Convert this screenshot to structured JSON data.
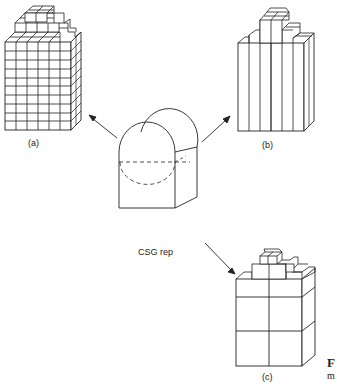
{
  "diagram": {
    "center": {
      "label": "CSG rep",
      "shape": "block-with-rounded-top"
    },
    "views": [
      {
        "id": "a",
        "label": "(a)",
        "description": "uniform voxel (spatial-occupancy) enumeration"
      },
      {
        "id": "b",
        "label": "(b)",
        "description": "column / ray representation"
      },
      {
        "id": "c",
        "label": "(c)",
        "description": "octree representation"
      }
    ],
    "arrows": [
      {
        "from": "CSG rep",
        "to": "(a)"
      },
      {
        "from": "CSG rep",
        "to": "(b)"
      },
      {
        "from": "CSG rep",
        "to": "(c)"
      }
    ],
    "page_fragment": {
      "letter_1": "F",
      "letter_2": "m"
    }
  },
  "colors": {
    "stroke": "#222222",
    "background": "#ffffff"
  }
}
